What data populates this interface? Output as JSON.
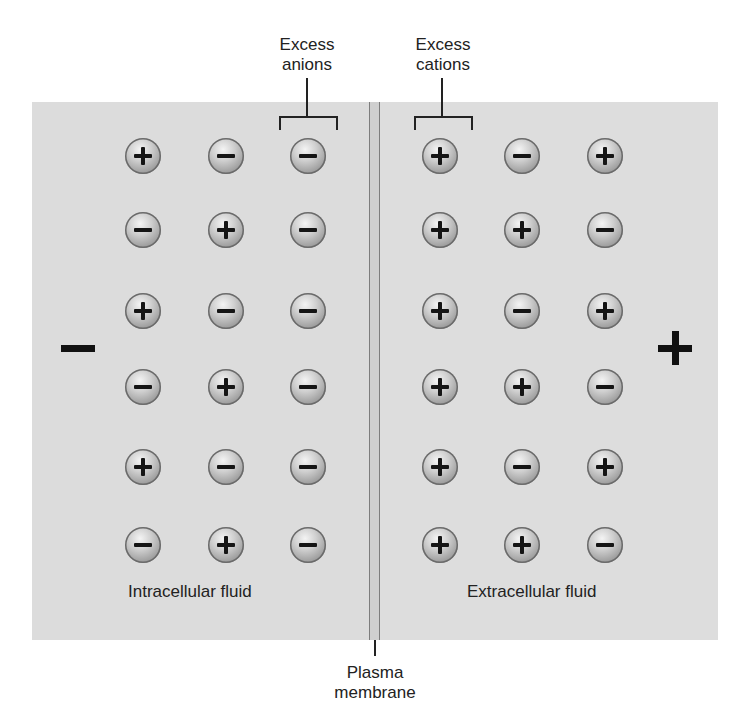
{
  "diagram": {
    "title_labels": {
      "excess_anions": "Excess\nanions",
      "excess_cations": "Excess\ncations",
      "plasma_membrane": "Plasma\nmembrane"
    },
    "intracellular": {
      "label": "Intracellular fluid",
      "side_charge": "−",
      "grid": [
        [
          "+",
          "−",
          "−"
        ],
        [
          "−",
          "+",
          "−"
        ],
        [
          "+",
          "−",
          "−"
        ],
        [
          "−",
          "+",
          "−"
        ],
        [
          "+",
          "−",
          "−"
        ],
        [
          "−",
          "+",
          "−"
        ]
      ]
    },
    "extracellular": {
      "label": "Extracellular fluid",
      "side_charge": "+",
      "grid": [
        [
          "+",
          "−",
          "+"
        ],
        [
          "+",
          "+",
          "−"
        ],
        [
          "+",
          "−",
          "+"
        ],
        [
          "+",
          "+",
          "−"
        ],
        [
          "+",
          "−",
          "+"
        ],
        [
          "+",
          "+",
          "−"
        ]
      ]
    },
    "colors": {
      "panel": "#dcdcdc",
      "membrane": "#cfcfcf",
      "ink": "#151515"
    }
  }
}
